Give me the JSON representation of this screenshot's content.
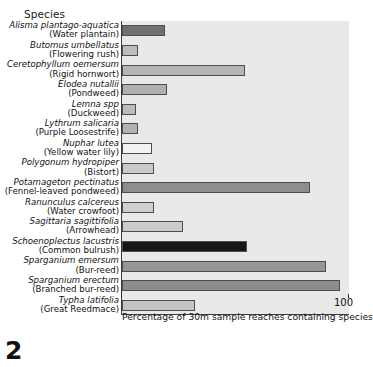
{
  "figure": {
    "number": "2",
    "species_header": "Species",
    "axis_title": "Percentage of 30m sample reaches containing species",
    "axis_max_label": "100"
  },
  "chart_data": {
    "type": "bar",
    "orientation": "horizontal",
    "title": "",
    "xlabel": "Percentage of 30m sample reaches containing species",
    "ylabel": "Species",
    "xlim": [
      0,
      100
    ],
    "xticks": [
      0,
      100
    ],
    "xticklabels": [
      "",
      "100"
    ],
    "grid": false,
    "legend": "none",
    "plot_background": "#e9e9e9",
    "categories": [
      "Alisma plantago-aquatica (Water plantain)",
      "Butomus umbellatus (Flowering rush)",
      "Ceretophyllum oemersum (Rigid hornwort)",
      "Elodea nutallii (Pondweed)",
      "Lemna spp (Duckweed)",
      "Lythrum salicaria (Purple Loosestrife)",
      "Nuphar lutea (Yellow water lily)",
      "Polygonum hydropiper (Bistort)",
      "Potamageton pectinatus (Fennel-leaved pondweed)",
      "Ranunculus calcereus (Water crowfoot)",
      "Sagittaria sagittifolia (Arrowhead)",
      "Schoenoplectus lacustris (Common bulrush)",
      "Sparganium emersum (Bur-reed)",
      "Sparganium erectum (Branched bur-reed)",
      "Typha latifolia (Great Reedmace)"
    ],
    "values": [
      19,
      7,
      54,
      20,
      6,
      7,
      13,
      14,
      83,
      14,
      27,
      55,
      90,
      96,
      32
    ],
    "bars": [
      {
        "scientific": "Alisma plantago-aquatica",
        "common": "(Water plantain)",
        "value": 19,
        "color": "#707070"
      },
      {
        "scientific": "Butomus umbellatus",
        "common": "(Flowering rush)",
        "value": 7,
        "color": "#bdbdbd"
      },
      {
        "scientific": "Ceretophyllum oemersum",
        "common": "(Rigid hornwort)",
        "value": 54,
        "color": "#b5b5b5"
      },
      {
        "scientific": "Elodea nutallii",
        "common": "(Pondweed)",
        "value": 20,
        "color": "#b0b0b0"
      },
      {
        "scientific": "Lemna spp",
        "common": "(Duckweed)",
        "value": 6,
        "color": "#bdbdbd"
      },
      {
        "scientific": "Lythrum salicaria",
        "common": "(Purple Loosestrife)",
        "value": 7,
        "color": "#b2b2b2"
      },
      {
        "scientific": "Nuphar lutea",
        "common": "(Yellow water lily)",
        "value": 13,
        "color": "#f2f2f2"
      },
      {
        "scientific": "Polygonum hydropiper",
        "common": "(Bistort)",
        "value": 14,
        "color": "#c9c9c9"
      },
      {
        "scientific": "Potamageton pectinatus",
        "common": "(Fennel-leaved pondweed)",
        "value": 83,
        "color": "#8e8e8e"
      },
      {
        "scientific": "Ranunculus calcereus",
        "common": "(Water crowfoot)",
        "value": 14,
        "color": "#cfcfcf"
      },
      {
        "scientific": "Sagittaria sagittifolia",
        "common": "(Arrowhead)",
        "value": 27,
        "color": "#cccccc"
      },
      {
        "scientific": "Schoenoplectus lacustris",
        "common": "(Common bulrush)",
        "value": 55,
        "color": "#161616"
      },
      {
        "scientific": "Sparganium emersum",
        "common": "(Bur-reed)",
        "value": 90,
        "color": "#979797"
      },
      {
        "scientific": "Sparganium erectum",
        "common": "(Branched bur-reed)",
        "value": 96,
        "color": "#8d8d8d"
      },
      {
        "scientific": "Typha latifolia",
        "common": "(Great Reedmace)",
        "value": 32,
        "color": "#c4c4c4"
      }
    ]
  }
}
